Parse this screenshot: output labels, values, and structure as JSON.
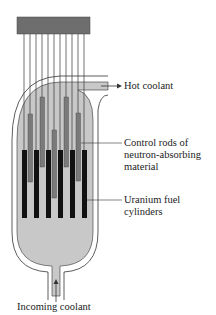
{
  "diagram": {
    "type": "nuclear-reactor-core",
    "labels": {
      "hot_coolant": "Hot coolant",
      "control_rods_line1": "Control rods of",
      "control_rods_line2": "neutron-absorbing",
      "control_rods_line3": "material",
      "fuel_line1": "Uranium fuel",
      "fuel_line2": "cylinders",
      "incoming": "Incoming coolant"
    },
    "colors": {
      "top_block": "#6e6e6e",
      "coolant": "#c8c8c8",
      "control_rod": "#7a7a7a",
      "fuel": "#111111",
      "outline": "#333333"
    }
  }
}
